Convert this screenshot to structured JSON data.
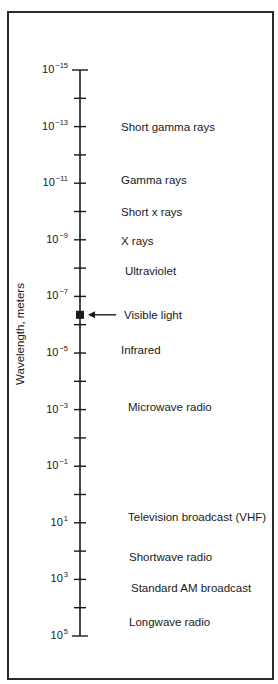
{
  "chart_data": {
    "type": "scale",
    "title": "",
    "ylabel": "Wavelength, meters",
    "axis": {
      "scale": "log10",
      "range": [
        -15,
        5
      ],
      "direction": "top-to-bottom increasing",
      "major_tick_exponents": [
        -15,
        -13,
        -11,
        -9,
        -7,
        -5,
        -3,
        -1,
        1,
        3,
        5
      ],
      "minor_tick_exponents": [
        -14,
        -12,
        -10,
        -8,
        -6,
        -4,
        -2,
        0,
        2,
        4
      ]
    },
    "tick_labels": [
      {
        "base": "10",
        "exp": "−15",
        "log": -15
      },
      {
        "base": "10",
        "exp": "−13",
        "log": -13
      },
      {
        "base": "10",
        "exp": "−11",
        "log": -11
      },
      {
        "base": "10",
        "exp": "−9",
        "log": -9
      },
      {
        "base": "10",
        "exp": "−7",
        "log": -7
      },
      {
        "base": "10",
        "exp": "−5",
        "log": -5
      },
      {
        "base": "10",
        "exp": "−3",
        "log": -3
      },
      {
        "base": "10",
        "exp": "−1",
        "log": -1
      },
      {
        "base": "10",
        "exp": "1",
        "log": 1
      },
      {
        "base": "10",
        "exp": "3",
        "log": 3
      },
      {
        "base": "10",
        "exp": "5",
        "log": 5
      }
    ],
    "bands": [
      {
        "label": "Short gamma rays",
        "log": -13
      },
      {
        "label": "Gamma rays",
        "log": -11.1
      },
      {
        "label": "Short x rays",
        "log": -10
      },
      {
        "label": "X rays",
        "log": -8.95
      },
      {
        "label": "Ultraviolet",
        "log": -7.9
      },
      {
        "label": "Visible light",
        "log": -6.35,
        "marker": "filled-square",
        "arrow": true
      },
      {
        "label": "Infrared",
        "log": -5.1
      },
      {
        "label": "Microwave radio",
        "log": -3.1
      },
      {
        "label": "Television broadcast (VHF)",
        "log": 0.8
      },
      {
        "label": "Shortwave radio",
        "log": 2.2
      },
      {
        "label": "Standard AM broadcast",
        "log": 3.3
      },
      {
        "label": "Longwave radio",
        "log": 4.5
      }
    ]
  },
  "colors": {
    "ink": "#1a1a1a",
    "frame": "#2a2a2a",
    "background": "#ffffff"
  }
}
